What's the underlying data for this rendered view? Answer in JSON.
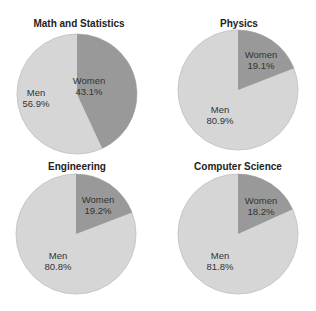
{
  "chart_data": [
    {
      "type": "pie",
      "title": "Math and Statistics",
      "categories": [
        "Women",
        "Men"
      ],
      "values": [
        43.1,
        56.9
      ]
    },
    {
      "type": "pie",
      "title": "Physics",
      "categories": [
        "Women",
        "Men"
      ],
      "values": [
        19.1,
        80.9
      ]
    },
    {
      "type": "pie",
      "title": "Engineering",
      "categories": [
        "Women",
        "Men"
      ],
      "values": [
        19.2,
        80.8
      ]
    },
    {
      "type": "pie",
      "title": "Computer Science",
      "categories": [
        "Women",
        "Men"
      ],
      "values": [
        18.2,
        81.8
      ]
    }
  ],
  "colors": {
    "women": "#999999",
    "men": "#d6d6d6",
    "edge": "#c8c8c8"
  },
  "labels": {
    "math": {
      "title": "Math and Statistics",
      "women": "Women",
      "women_pct": "43.1%",
      "men": "Men",
      "men_pct": "56.9%"
    },
    "physics": {
      "title": "Physics",
      "women": "Women",
      "women_pct": "19.1%",
      "men": "Men",
      "men_pct": "80.9%"
    },
    "engineering": {
      "title": "Engineering",
      "women": "Women",
      "women_pct": "19.2%",
      "men": "Men",
      "men_pct": "80.8%"
    },
    "cs": {
      "title": "Computer Science",
      "women": "Women",
      "women_pct": "18.2%",
      "men": "Men",
      "men_pct": "81.8%"
    }
  }
}
